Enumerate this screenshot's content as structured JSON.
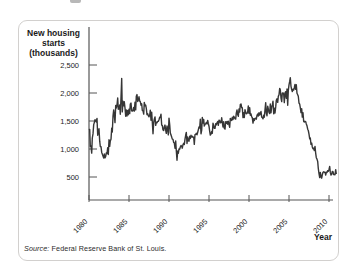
{
  "figure": {
    "axis_title_lines": [
      "New housing",
      "starts",
      "(thousands)"
    ],
    "x_axis_label": "Year",
    "source_label": "Source:",
    "source_text": "Federal Reserve Bank of St. Louis."
  },
  "chart_data": {
    "type": "line",
    "title": "New housing starts (thousands)",
    "xlabel": "Year",
    "ylabel": "New housing starts (thousands)",
    "frequency": "monthly",
    "x_start_year": 1980,
    "x_end_year": 2010,
    "x_ticks": [
      1980,
      1985,
      1990,
      1995,
      2000,
      2005,
      2010
    ],
    "x_tick_labels": [
      "1980",
      "1985",
      "1990",
      "1995",
      "2000",
      "2005",
      "2010"
    ],
    "y_tick_values": [
      500,
      1000,
      1500,
      2000,
      2500
    ],
    "y_tick_labels": [
      "500",
      "1,000",
      "1,500",
      "2,000",
      "2,500"
    ],
    "ylim": [
      0,
      2600
    ],
    "grid": false,
    "legend_position": "none",
    "line_color": "#363636",
    "source": "Source: Federal Reserve Bank of St. Louis.",
    "series": [
      {
        "name": "New housing starts (thousands, monthly)",
        "start": "1980-01",
        "end": "2010-12",
        "values": [
          1341,
          1350,
          1047,
          1051,
          927,
          1196,
          1269,
          1436,
          1471,
          1523,
          1510,
          1482,
          1547,
          1246,
          1306,
          1360,
          1140,
          1045,
          1041,
          940,
          911,
          873,
          837,
          910,
          843,
          866,
          931,
          917,
          1025,
          902,
          1166,
          1046,
          1144,
          1173,
          1372,
          1303,
          1586,
          1699,
          1606,
          1472,
          1776,
          1733,
          1785,
          1910,
          1710,
          1715,
          1785,
          1621,
          1919,
          2260,
          1663,
          1851,
          1774,
          1843,
          1732,
          1586,
          1698,
          1590,
          1689,
          1612,
          1711,
          1632,
          1800,
          1821,
          1680,
          1676,
          1684,
          1743,
          1676,
          1834,
          1698,
          1942,
          1972,
          1848,
          1876,
          1933,
          1854,
          1847,
          1782,
          1807,
          1687,
          1681,
          1623,
          1833,
          1774,
          1784,
          1726,
          1614,
          1628,
          1594,
          1575,
          1605,
          1695,
          1515,
          1656,
          1486,
          1271,
          1473,
          1532,
          1573,
          1421,
          1478,
          1467,
          1493,
          1492,
          1522,
          1569,
          1563,
          1621,
          1425,
          1422,
          1339,
          1331,
          1397,
          1427,
          1332,
          1279,
          1410,
          1351,
          1251,
          1551,
          1437,
          1289,
          1248,
          1212,
          1177,
          1171,
          1115,
          1110,
          1014,
          1145,
          969,
          798,
          965,
          921,
          1001,
          996,
          1036,
          1063,
          1049,
          1015,
          1079,
          1103,
          1079,
          1176,
          1250,
          1297,
          1099,
          1214,
          1145,
          1139,
          1226,
          1186,
          1244,
          1214,
          1227,
          1210,
          1210,
          1083,
          1258,
          1260,
          1280,
          1254,
          1300,
          1343,
          1392,
          1376,
          1533,
          1272,
          1337,
          1564,
          1465,
          1526,
          1409,
          1439,
          1450,
          1474,
          1450,
          1511,
          1455,
          1407,
          1316,
          1249,
          1267,
          1314,
          1281,
          1461,
          1416,
          1369,
          1369,
          1452,
          1431,
          1467,
          1491,
          1424,
          1516,
          1504,
          1467,
          1472,
          1557,
          1475,
          1392,
          1489,
          1370,
          1355,
          1486,
          1457,
          1492,
          1442,
          1494,
          1437,
          1390,
          1546,
          1520,
          1510,
          1566,
          1525,
          1584,
          1567,
          1540,
          1536,
          1641,
          1698,
          1614,
          1582,
          1715,
          1660,
          1792,
          1804,
          1738,
          1737,
          1561,
          1649,
          1562,
          1704,
          1657,
          1628,
          1636,
          1663,
          1769,
          1636,
          1737,
          1604,
          1626,
          1575,
          1559,
          1463,
          1541,
          1507,
          1549,
          1551,
          1532,
          1600,
          1625,
          1590,
          1649,
          1605,
          1636,
          1670,
          1567,
          1562,
          1540,
          1602,
          1568,
          1698,
          1829,
          1642,
          1592,
          1764,
          1717,
          1655,
          1633,
          1804,
          1648,
          1753,
          1788,
          1853,
          1629,
          1726,
          1643,
          1751,
          1867,
          1897,
          1833,
          1939,
          1967,
          2083,
          2057,
          1911,
          1846,
          1998,
          2003,
          1981,
          1828,
          2002,
          2024,
          1905,
          2072,
          1782,
          2042,
          2144,
          2207,
          2273,
          2119,
          2061,
          2025,
          2068,
          2054,
          2095,
          2151,
          2065,
          2147,
          1994,
          1969,
          1942,
          1821,
          1802,
          1737,
          1650,
          1720,
          1570,
          1649,
          1491,
          1480,
          1495,
          1490,
          1448,
          1415,
          1354,
          1330,
          1264,
          1183,
          1197,
          1084,
          1103,
          1037,
          1005,
          1013,
          973,
          1046,
          923,
          844,
          820,
          777,
          652,
          560,
          490,
          582,
          505,
          478,
          540,
          585,
          594,
          586,
          585,
          534,
          588,
          581,
          614,
          604,
          636,
          687,
          583,
          536,
          546,
          599,
          594,
          543,
          545,
          539,
          630,
          554
        ]
      }
    ]
  }
}
